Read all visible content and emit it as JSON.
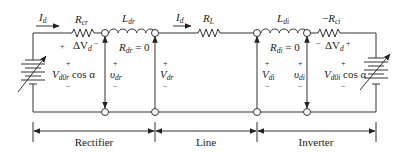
{
  "diagram": {
    "current_labels": {
      "left": {
        "main": "I",
        "sub": "d"
      },
      "middle": {
        "main": "I",
        "sub": "d"
      }
    },
    "components": {
      "rcr": {
        "main": "R",
        "sub": "cr"
      },
      "ldr": {
        "main": "L",
        "sub": "dr"
      },
      "rdr": {
        "main": "R",
        "sub": "dr",
        "suffix": " = 0"
      },
      "rl": {
        "main": "R",
        "sub": "L"
      },
      "ldi": {
        "main": "L",
        "sub": "di"
      },
      "rdi": {
        "main": "R",
        "sub": "di",
        "suffix": " = 0"
      },
      "rci": {
        "prefix": "−",
        "main": "R",
        "sub": "ci"
      }
    },
    "voltages": {
      "delta_vd_left": {
        "plus": "+",
        "main": "ΔV",
        "sub": "d",
        "minus": "−"
      },
      "delta_vd_right": {
        "minus": "−",
        "main": "ΔV",
        "sub": "d",
        "plus": "+"
      },
      "vd0r": {
        "main": "V",
        "sub": "d0r",
        "suffix": " cos α",
        "plus": "+",
        "minus": "−"
      },
      "vdr_small": {
        "main": "υ",
        "sub": "dr",
        "plus": "+",
        "minus": "−"
      },
      "vdr": {
        "main": "V",
        "sub": "dr",
        "plus": "+",
        "minus": "−"
      },
      "vdi": {
        "main": "V",
        "sub": "di",
        "plus": "+",
        "minus": "−"
      },
      "vdi_small": {
        "main": "υ",
        "sub": "di",
        "plus": "+",
        "minus": "−"
      },
      "vd0i": {
        "main": "V",
        "sub": "d0i",
        "suffix": " cos α",
        "plus": "+",
        "minus": "−"
      }
    },
    "regions": [
      {
        "label": "Rectifier"
      },
      {
        "label": "Line"
      },
      {
        "label": "Inverter"
      }
    ],
    "icons": [
      "variable-battery-icon",
      "resistor-icon",
      "inductor-icon",
      "node-icon",
      "arrow-icon"
    ]
  }
}
